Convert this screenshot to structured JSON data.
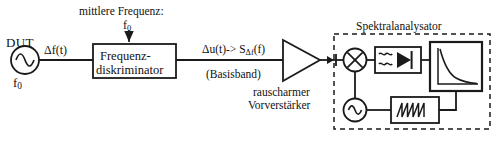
{
  "diagram": {
    "title": "Spektralanalysator",
    "language": "de",
    "background_color": "#ffffff",
    "line_color": "#1a1a1a"
  },
  "labels": {
    "dut": "DUT",
    "dut_frequency": "f",
    "dut_frequency_sub": "0",
    "delta_f_signal": "Δf(t)",
    "mittlere_frequenz": "mittlere Frequenz:",
    "mittlere_frequenz_value": "f",
    "mittlere_frequenz_value_sub": "0",
    "diskriminator_line1": "Frequenz-",
    "diskriminator_line2": "diskriminator",
    "delta_u_signal": "Δu(t)-> S",
    "delta_u_signal_sub": "Δf",
    "delta_u_signal_tail": "(f)",
    "basisband": "(Basisband)",
    "preamp_line1": "rauscharmer",
    "preamp_line2": "Vorverstärker",
    "spektralanalysator": "Spektralanalysator"
  },
  "blocks": [
    {
      "name": "dut-source",
      "type": "sine-source",
      "label": "DUT"
    },
    {
      "name": "frequenzdiskriminator",
      "type": "rect-block",
      "label": "Frequenz-diskriminator"
    },
    {
      "name": "preamplifier",
      "type": "triangle-amp",
      "label": "rauscharmer Vorverstärker"
    },
    {
      "name": "mixer",
      "type": "mixer-circle-x",
      "label": "Mischer"
    },
    {
      "name": "filter-detector",
      "type": "filter-diode",
      "label": "Filter / Detektor"
    },
    {
      "name": "display-screen",
      "type": "screen-plot",
      "label": "Anzeige"
    },
    {
      "name": "local-oscillator",
      "type": "sine-source",
      "label": "Lokaloszillator"
    },
    {
      "name": "sweep-generator",
      "type": "sawtooth-block",
      "label": "Sägezahngenerator"
    }
  ],
  "screen_plot": {
    "type": "line",
    "description": "decaying 1/f noise spectral density curve",
    "xlabel": "",
    "ylabel": ""
  }
}
